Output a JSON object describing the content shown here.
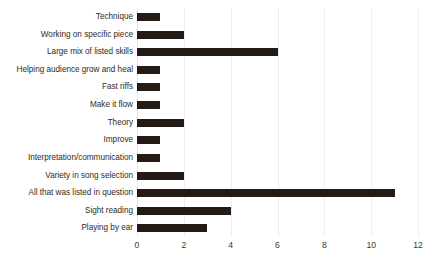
{
  "chart_data": {
    "type": "bar",
    "orientation": "horizontal",
    "title": "",
    "xlabel": "",
    "ylabel": "",
    "categories": [
      "Technique",
      "Working on specific piece",
      "Large mix of listed skills",
      "Helping audience grow and heal",
      "Fast riffs",
      "Make it flow",
      "Theory",
      "Improve",
      "Interpretation/communication",
      "Variety in song selection",
      "All that was listed in question",
      "Sight reading",
      "Playing by ear"
    ],
    "values": [
      1,
      2,
      6,
      1,
      1,
      1,
      2,
      1,
      1,
      2,
      11,
      4,
      3
    ],
    "xlim": [
      0,
      12
    ],
    "xticks": [
      0,
      2,
      4,
      6,
      8,
      10,
      12
    ],
    "xtick_labels": [
      "0",
      "2",
      "4",
      "6",
      "8",
      "10",
      "12"
    ],
    "grid": true,
    "grid_axis": "x",
    "legend": false,
    "bar_color": "#241a16",
    "gridline_color": "#efeeed",
    "label_color": "#2f2b28",
    "background_color": "#ffffff"
  }
}
